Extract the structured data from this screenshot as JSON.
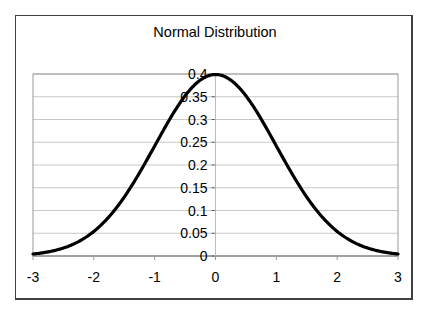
{
  "chart_data": {
    "type": "line",
    "title": "Normal Distribution",
    "xlabel": "",
    "ylabel": "",
    "xlim": [
      -3,
      3
    ],
    "ylim": [
      0,
      0.4
    ],
    "grid": {
      "horizontal": true,
      "vertical": false
    },
    "legend": null,
    "x_ticks": [
      "-3",
      "-2",
      "-1",
      "0",
      "1",
      "2",
      "3"
    ],
    "y_ticks": [
      "0",
      "0.05",
      "0.1",
      "0.15",
      "0.2",
      "0.25",
      "0.3",
      "0.35",
      "0.4"
    ],
    "series": [
      {
        "name": "Standard normal PDF",
        "color": "#000000",
        "x": [
          -3,
          -2.75,
          -2.5,
          -2.25,
          -2,
          -1.75,
          -1.5,
          -1.25,
          -1,
          -0.75,
          -0.5,
          -0.25,
          0,
          0.25,
          0.5,
          0.75,
          1,
          1.25,
          1.5,
          1.75,
          2,
          2.25,
          2.5,
          2.75,
          3
        ],
        "values": [
          0.0044,
          0.0091,
          0.0175,
          0.0317,
          0.054,
          0.0863,
          0.1295,
          0.1826,
          0.242,
          0.3011,
          0.3521,
          0.3867,
          0.3989,
          0.3867,
          0.3521,
          0.3011,
          0.242,
          0.1826,
          0.1295,
          0.0863,
          0.054,
          0.0317,
          0.0175,
          0.0091,
          0.0044
        ]
      }
    ]
  },
  "colors": {
    "frame": "#404040",
    "plot_border": "#9a9a9a",
    "gridline": "#c8c8c8",
    "curve": "#000000"
  }
}
